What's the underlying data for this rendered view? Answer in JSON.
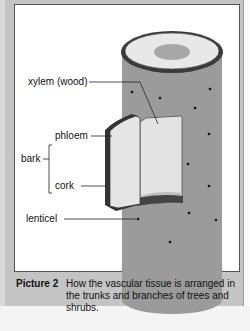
{
  "diagram": {
    "labels": {
      "xylem": "xylem (wood)",
      "phloem": "phloem",
      "bark": "bark",
      "cork": "cork",
      "lenticel": "lenticel"
    },
    "colors": {
      "frame": "#c4c4c4",
      "trunk": "#999999",
      "wood_top": "#e6e6e6",
      "pith": "#a6a6a6",
      "bark_strip": "#d9d9d9"
    }
  },
  "caption": {
    "title": "Picture 2",
    "text": "How the vascular tissue is arranged in the trunks and branches of trees and shrubs."
  }
}
